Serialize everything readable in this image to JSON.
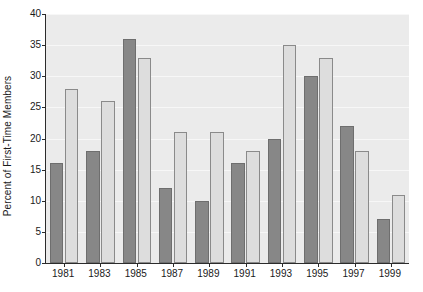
{
  "chart_data": {
    "type": "bar",
    "title": "",
    "xlabel": "",
    "ylabel": "Percent of First-Time Members",
    "categories": [
      "1981",
      "1983",
      "1985",
      "1987",
      "1989",
      "1991",
      "1993",
      "1995",
      "1997",
      "1999"
    ],
    "series": [
      {
        "name": "dark-series",
        "color": "#878787",
        "values": [
          16,
          18,
          36,
          12,
          10,
          16,
          20,
          30,
          22,
          7
        ]
      },
      {
        "name": "light-series",
        "color": "#dddddd",
        "values": [
          28,
          26,
          33,
          21,
          21,
          18,
          35,
          33,
          18,
          11
        ]
      }
    ],
    "ylim": [
      0,
      40
    ],
    "yticks": [
      0,
      5,
      10,
      15,
      20,
      25,
      30,
      35,
      40
    ],
    "ytick_labels": [
      "0",
      "5",
      "10",
      "15",
      "20",
      "25",
      "30",
      "35",
      "40"
    ],
    "xtick_labels": [
      "1981",
      "1983",
      "1985",
      "1987",
      "1989",
      "1991",
      "1993",
      "1995",
      "1997",
      "1999"
    ],
    "grid": true,
    "grid_color": "#f7f7f7",
    "plot_background": "#ebebeb",
    "figure_background": "#ffffff",
    "axis_color": "#2b2b2b",
    "legend": null,
    "legend_position": "none"
  }
}
